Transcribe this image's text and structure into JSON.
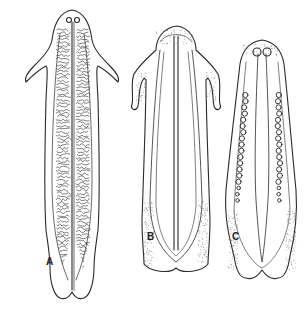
{
  "figure": {
    "ink_color": "#2a2a2a",
    "background": "#ffffff",
    "panels": [
      {
        "label": "A",
        "name": "specimen-a",
        "feature": "branched intestinal diverticula"
      },
      {
        "label": "B",
        "name": "specimen-b",
        "feature": "central canal with stippled margins"
      },
      {
        "label": "C",
        "name": "specimen-c",
        "feature": "paired rows of round follicles"
      }
    ]
  }
}
